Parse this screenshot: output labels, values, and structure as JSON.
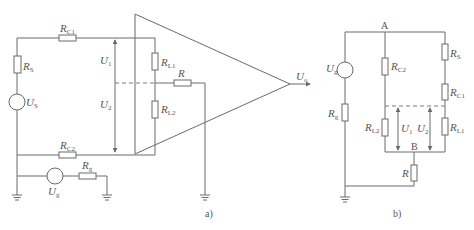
{
  "diagram_a": {
    "label": "a)",
    "components": {
      "RC1": {
        "main": "R",
        "sub": "C1"
      },
      "RS": {
        "main": "R",
        "sub": "S"
      },
      "US": {
        "main": "U",
        "sub": "S"
      },
      "RC2": {
        "main": "R",
        "sub": "C2"
      },
      "U1": {
        "main": "U",
        "sub": "1"
      },
      "U2": {
        "main": "U",
        "sub": "2"
      },
      "RL1": {
        "main": "R",
        "sub": "L1"
      },
      "RL2": {
        "main": "R",
        "sub": "L2"
      },
      "R": {
        "main": "R"
      },
      "Uo": {
        "main": "U",
        "sub": "o"
      },
      "Ug": {
        "main": "U",
        "sub": "g"
      },
      "Rg": {
        "main": "R",
        "sub": "g"
      }
    }
  },
  "diagram_b": {
    "label": "b)",
    "nodes": {
      "A": "A",
      "B": "B"
    },
    "components": {
      "Ug": {
        "main": "U",
        "sub": "g"
      },
      "Rg": {
        "main": "R",
        "sub": "g"
      },
      "RC2": {
        "main": "R",
        "sub": "C2"
      },
      "RL2": {
        "main": "R",
        "sub": "L2"
      },
      "U1": {
        "main": "U",
        "sub": "1"
      },
      "U2": {
        "main": "U",
        "sub": "2"
      },
      "RS": {
        "main": "R",
        "sub": "S"
      },
      "RC1": {
        "main": "R",
        "sub": "C1"
      },
      "RL1": {
        "main": "R",
        "sub": "L1"
      },
      "R": {
        "main": "R"
      }
    }
  }
}
